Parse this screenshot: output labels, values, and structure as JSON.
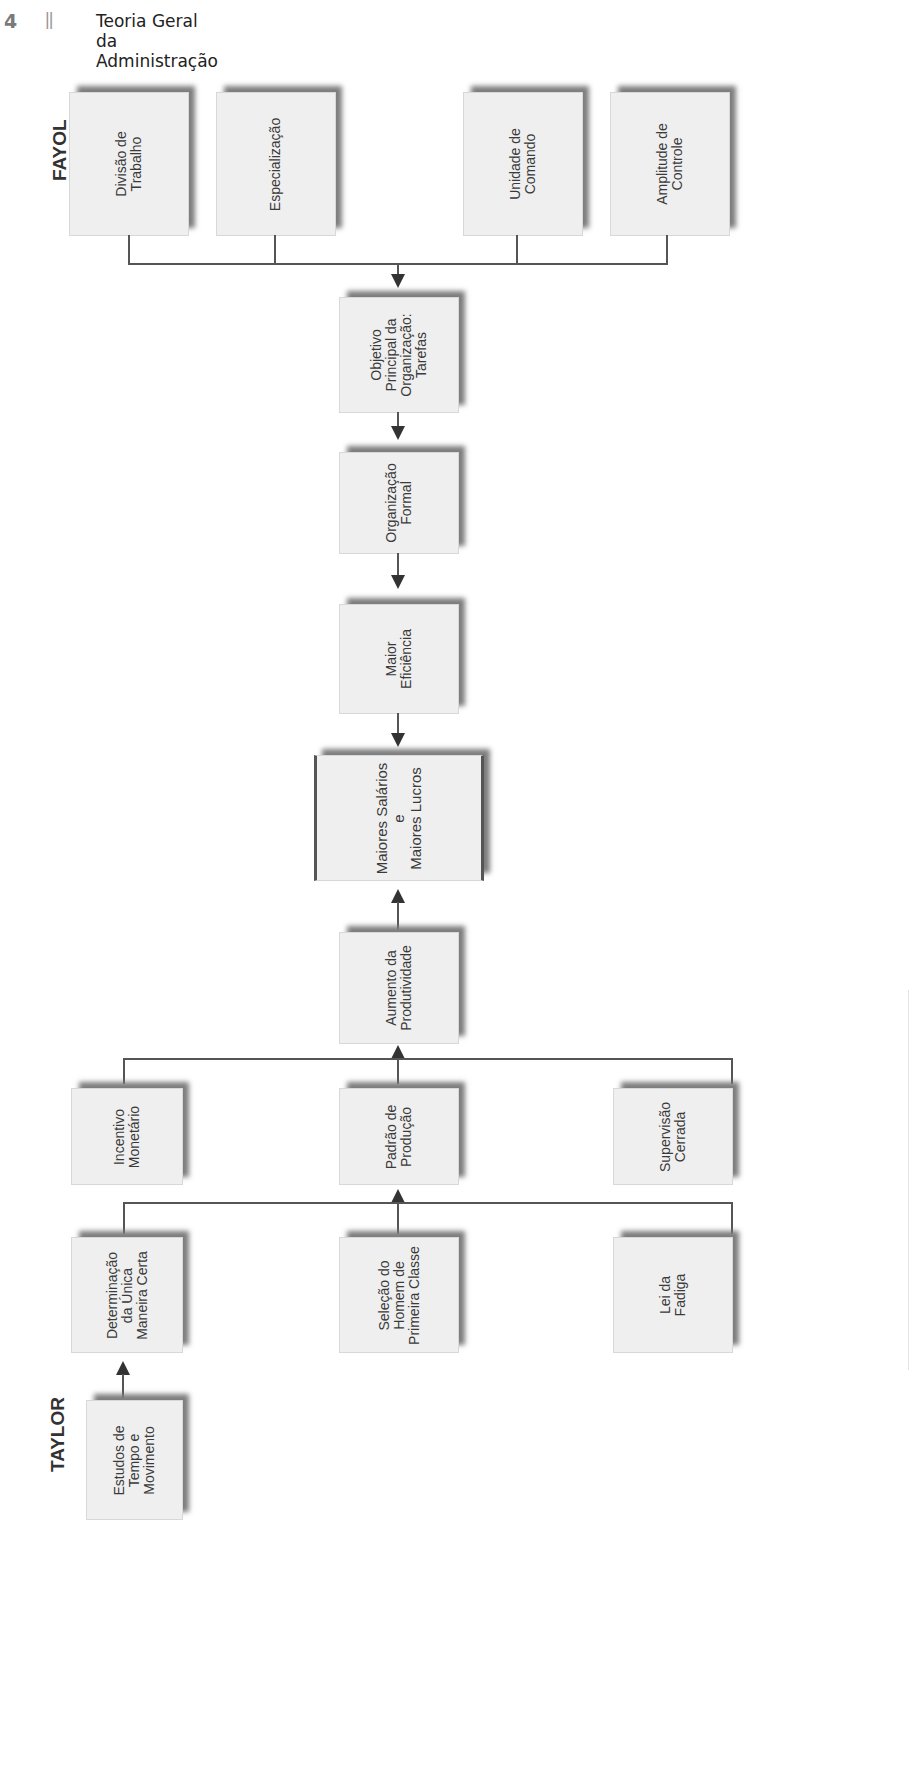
{
  "header": {
    "page_number": "4",
    "separator": "||",
    "title": "Teoria Geral da Administração"
  },
  "labels": {
    "fayol": "FAYOL",
    "taylor": "TAYLOR"
  },
  "fayol_boxes": [
    {
      "id": "divisao-trabalho",
      "text": "Divisão de\nTrabalho"
    },
    {
      "id": "especializacao",
      "text": "Especialização"
    },
    {
      "id": "unidade-comando",
      "text": "Unidade de\nComando"
    },
    {
      "id": "amplitude-controle",
      "text": "Amplitude de\nControle"
    }
  ],
  "center_boxes": [
    {
      "id": "objetivo-principal",
      "text": "Objetivo\nPrincipal da\nOrganização:\nTarefas"
    },
    {
      "id": "organizacao-formal",
      "text": "Organização\nFormal"
    },
    {
      "id": "maior-eficiencia",
      "text": "Maior\nEficiência"
    },
    {
      "id": "maiores-salarios-lucros",
      "text": "Maiores Salários\ne\nMaiores Lucros"
    },
    {
      "id": "aumento-produtividade",
      "text": "Aumento da\nProdutividade"
    }
  ],
  "taylor_row1": [
    {
      "id": "incentivo-monetario",
      "text": "Incentivo\nMonetário"
    },
    {
      "id": "padrao-producao",
      "text": "Padrão de\nProdução"
    },
    {
      "id": "supervisao-cerrada",
      "text": "Supervisão\nCerrada"
    }
  ],
  "taylor_row2": [
    {
      "id": "determinacao-unica-maneira",
      "text": "Determinação\nda Única\nManeira Certa"
    },
    {
      "id": "selecao-homem-primeira-classe",
      "text": "Seleção do\nHomem de\nPrimeira Classe"
    },
    {
      "id": "lei-fadiga",
      "text": "Lei da\nFadiga"
    }
  ],
  "taylor_base": {
    "id": "estudos-tempo-movimento",
    "text": "Estudos de\nTempo e\nMovimento"
  },
  "colors": {
    "box_fill": "#efefef",
    "box_shadow": "#7d7d7d",
    "line": "#555555",
    "arrow": "#333333",
    "text": "#3a3a3a"
  }
}
